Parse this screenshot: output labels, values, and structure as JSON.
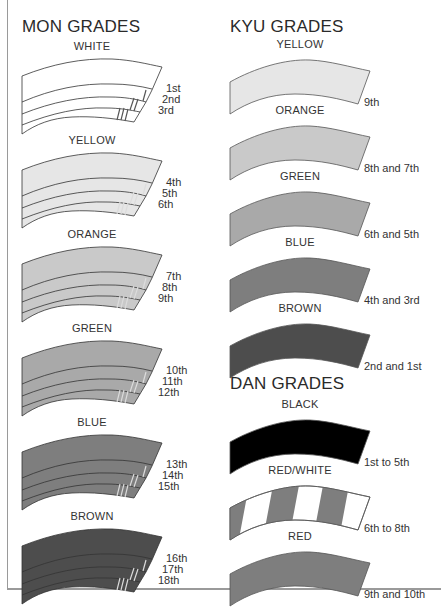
{
  "mon": {
    "title": "MON GRADES",
    "belts": [
      {
        "label": "WHITE",
        "color": "#ffffff",
        "grades": [
          "1st",
          "2nd",
          "3rd"
        ]
      },
      {
        "label": "YELLOW",
        "color": "#e6e6e6",
        "grades": [
          "4th",
          "5th",
          "6th"
        ]
      },
      {
        "label": "ORANGE",
        "color": "#c9c9c9",
        "grades": [
          "7th",
          "8th",
          "9th"
        ]
      },
      {
        "label": "GREEN",
        "color": "#a9a9a9",
        "grades": [
          "10th",
          "11th",
          "12th"
        ]
      },
      {
        "label": "BLUE",
        "color": "#7e7e7e",
        "grades": [
          "13th",
          "14th",
          "15th"
        ]
      },
      {
        "label": "BROWN",
        "color": "#4d4d4d",
        "grades": [
          "16th",
          "17th",
          "18th"
        ]
      }
    ]
  },
  "kyu": {
    "title": "KYU GRADES",
    "belts": [
      {
        "label": "YELLOW",
        "color": "#e6e6e6",
        "grade": "9th"
      },
      {
        "label": "ORANGE",
        "color": "#c9c9c9",
        "grade": "8th and 7th"
      },
      {
        "label": "GREEN",
        "color": "#a9a9a9",
        "grade": "6th and 5th"
      },
      {
        "label": "BLUE",
        "color": "#7e7e7e",
        "grade": "4th and 3rd"
      },
      {
        "label": "BROWN",
        "color": "#4d4d4d",
        "grade": "2nd and 1st"
      }
    ]
  },
  "dan": {
    "title": "DAN GRADES",
    "belts": [
      {
        "label": "BLACK",
        "color": "#000000",
        "grade": "1st to 5th"
      },
      {
        "label": "RED/WHITE",
        "color": "#7e7e7e",
        "stripe_color": "#ffffff",
        "grade": "6th to 8th"
      },
      {
        "label": "RED",
        "color": "#7e7e7e",
        "grade": "9th and 10th"
      }
    ]
  }
}
